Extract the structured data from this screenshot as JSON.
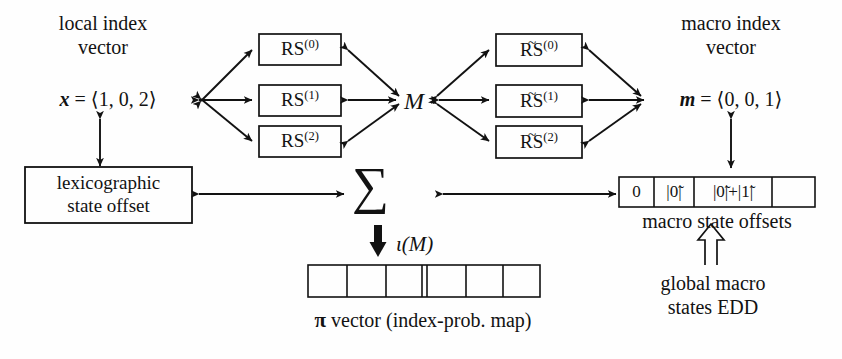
{
  "figure": {
    "background_color": "#fefefe",
    "ink_color": "#121212"
  },
  "left_column": {
    "heading_line1": "local index",
    "heading_line2": "vector",
    "vector_label": "x",
    "vector_equals": "=",
    "vector_value": "⟨1, 0, 2⟩",
    "offset_box_line1": "lexicographic",
    "offset_box_line2": "state offset"
  },
  "left_rs_boxes": [
    {
      "base": "RS",
      "superscript": "(0)",
      "tilde": false
    },
    {
      "base": "RS",
      "superscript": "(1)",
      "tilde": false
    },
    {
      "base": "RS",
      "superscript": "(2)",
      "tilde": false
    }
  ],
  "center": {
    "matrix_label": "M",
    "sum_symbol": "∑",
    "iota_label": "ι(M)",
    "pi_caption_symbol": "π",
    "pi_caption_rest": "vector (index-prob. map)",
    "pi_cells": [
      "",
      "",
      "",
      "",
      "",
      ""
    ],
    "pi_double_divider_after_cell": 3
  },
  "right_rs_boxes": [
    {
      "base": "RS",
      "superscript": "(0)",
      "tilde": true
    },
    {
      "base": "RS",
      "superscript": "(1)",
      "tilde": true
    },
    {
      "base": "RS",
      "superscript": "(2)",
      "tilde": true
    }
  ],
  "right_column": {
    "heading_line1": "macro index",
    "heading_line2": "vector",
    "vector_label": "m",
    "vector_equals": "=",
    "vector_value": "⟨0, 0, 1⟩",
    "offsets_caption": "macro state offsets",
    "offsets_cells": [
      "0",
      "|0̃|",
      "|0̃|+|1̃|",
      ""
    ],
    "edd_line1": "global macro",
    "edd_line2": "states EDD"
  }
}
